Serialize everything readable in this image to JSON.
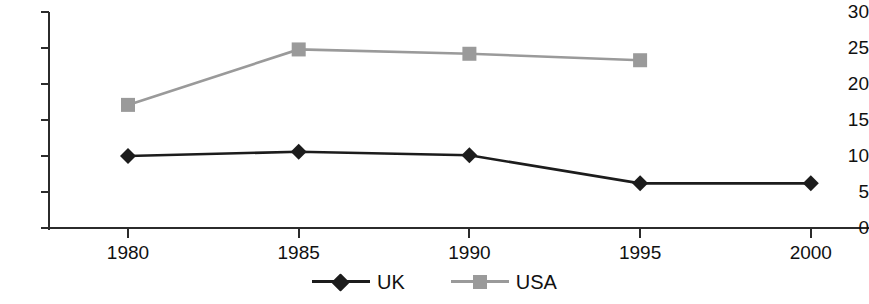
{
  "chart_data": {
    "type": "line",
    "title": "",
    "subtitle": "",
    "xlabel": "",
    "ylabel": "",
    "x": [
      1980,
      1985,
      1990,
      1995,
      2000
    ],
    "categories": [
      "1980",
      "1985",
      "1990",
      "1995",
      "2000"
    ],
    "xlim": [
      1978,
      2002
    ],
    "ylim": [
      0,
      30
    ],
    "y_ticks": [
      0,
      5,
      10,
      15,
      20,
      25,
      30
    ],
    "y_tick_labels": [
      "0",
      "5",
      "10",
      "15",
      "20",
      "25",
      "30"
    ],
    "x_tick_labels": [
      "1980",
      "1985",
      "1990",
      "1995",
      "2000"
    ],
    "grid": false,
    "legend_position": "bottom-center",
    "series": [
      {
        "name": "UK",
        "color": "#1c1c1c",
        "marker": "diamond",
        "x": [
          1980,
          1985,
          1990,
          1995,
          2000
        ],
        "values": [
          10.0,
          10.6,
          10.1,
          6.2,
          6.2
        ]
      },
      {
        "name": "USA",
        "color": "#9a9a9a",
        "marker": "square",
        "x": [
          1980,
          1985,
          1990,
          1995
        ],
        "values": [
          17.1,
          24.8,
          24.2,
          23.3
        ]
      }
    ]
  },
  "legend": {
    "items": [
      {
        "label": "UK"
      },
      {
        "label": "USA"
      }
    ]
  },
  "colors": {
    "axis": "#2b2b2b",
    "uk": "#1c1c1c",
    "usa": "#9a9a9a",
    "background": "#ffffff"
  }
}
